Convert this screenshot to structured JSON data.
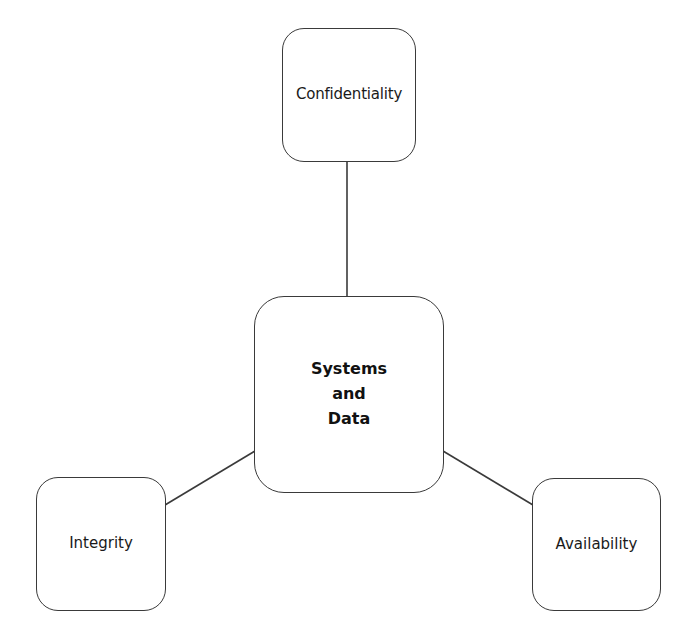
{
  "diagram": {
    "type": "hub-and-spoke",
    "center": {
      "id": "center",
      "label": "Systems\nand\nData",
      "bold": true
    },
    "nodes": [
      {
        "id": "confidentiality",
        "label": "Confidentiality",
        "position": "top"
      },
      {
        "id": "integrity",
        "label": "Integrity",
        "position": "bottom-left"
      },
      {
        "id": "availability",
        "label": "Availability",
        "position": "bottom-right"
      }
    ],
    "edges": [
      {
        "from": "center",
        "to": "confidentiality"
      },
      {
        "from": "center",
        "to": "integrity"
      },
      {
        "from": "center",
        "to": "availability"
      }
    ],
    "colors": {
      "stroke": "#3a3a3a",
      "fill": "#ffffff",
      "text": "#1a1a1a"
    }
  }
}
